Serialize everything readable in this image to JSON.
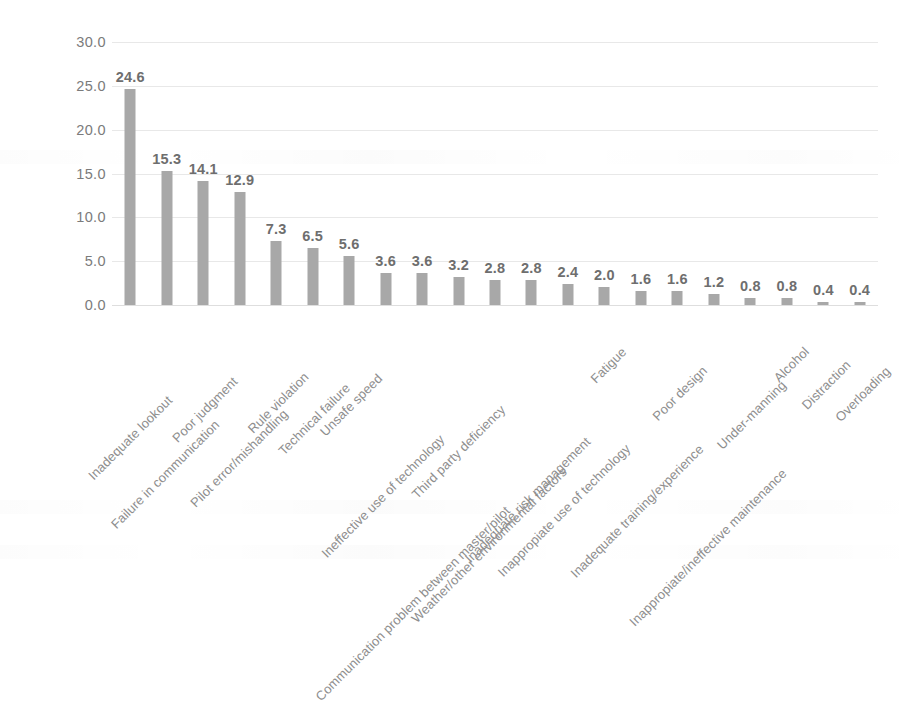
{
  "chart_data": {
    "type": "bar",
    "title": "",
    "subtitle": "",
    "xlabel": "",
    "ylabel": "",
    "ylim": [
      0,
      30
    ],
    "ytick_labels": [
      "30.0",
      "25.0",
      "20.0",
      "15.0",
      "10.0",
      "5.0",
      "0.0"
    ],
    "yticks": [
      30,
      25,
      20,
      15,
      10,
      5,
      0
    ],
    "grid": true,
    "legend": "none",
    "bar_color": "#a8a8a8",
    "label_color": "#6e6e6e",
    "gridline_color": "#e8e8e8",
    "categories": [
      "Inadequate lookout",
      "Failure in communication",
      "Poor judgment",
      "Pilot error/mishandling",
      "Rule violation",
      "Technical failure",
      "Unsafe speed",
      "Ineffective use of technology",
      "Communication problem between master/pilot",
      "Third party deficiency",
      "Weather/other environmental factors",
      "Inadequate risk management",
      "Inappropiate use of technology",
      "Fatigue",
      "Inadequate training/experience",
      "Poor design",
      "Inappropiate/ineffective maintenance",
      "Under-manning",
      "Alcohol",
      "Distraction",
      "Overloading"
    ],
    "values": [
      24.6,
      15.3,
      14.1,
      12.9,
      7.3,
      6.5,
      5.6,
      3.6,
      3.6,
      3.2,
      2.8,
      2.8,
      2.4,
      2.0,
      1.6,
      1.6,
      1.2,
      0.8,
      0.8,
      0.4,
      0.4
    ],
    "value_labels": [
      "24.6",
      "15.3",
      "14.1",
      "12.9",
      "7.3",
      "6.5",
      "5.6",
      "3.6",
      "3.6",
      "3.2",
      "2.8",
      "2.8",
      "2.4",
      "2.0",
      "1.6",
      "1.6",
      "1.2",
      "0.8",
      "0.8",
      "0.4",
      "0.4"
    ]
  }
}
